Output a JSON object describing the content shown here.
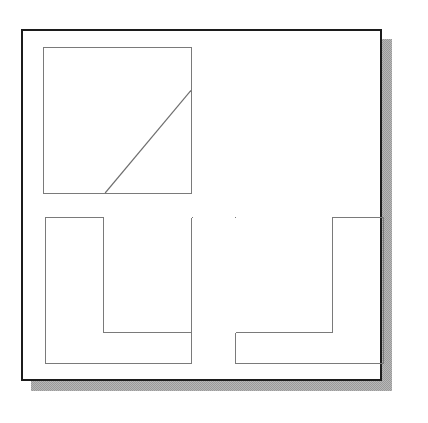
{
  "figure": {
    "title": "",
    "background_color": "#ffffff",
    "frame": {
      "name": "outer-frame",
      "x": 21,
      "y": 29,
      "width": 361,
      "height": 352,
      "stroke_color": "#1c1c1c",
      "stroke_width": 2,
      "fill_color": "#ffffff"
    },
    "shadow": {
      "name": "drop-shadow",
      "offset_x": 10,
      "offset_y": 10,
      "color": "#9a9a9a",
      "style": "dithered-halftone"
    },
    "panels": [
      {
        "id": "panel-top-left",
        "label": "",
        "shape": "square-with-diagonal",
        "x": 41,
        "y": 45,
        "width": 149,
        "height": 147,
        "stroke_color": "#7a7a7a",
        "stroke_width": 1,
        "diagonal": {
          "x1": 103,
          "y1": 192,
          "x2": 190,
          "y2": 88,
          "stroke_color": "#6e6e6e",
          "stroke_width": 1
        }
      },
      {
        "id": "panel-bottom-left",
        "label": "",
        "shape": "square-with-inset-upper-right",
        "outer": {
          "x": 43,
          "y": 215,
          "width": 147,
          "height": 147
        },
        "inner": {
          "x": 101,
          "y": 215,
          "width": 90,
          "height": 116
        },
        "stroke_color": "#7a7a7a",
        "stroke_width": 1
      },
      {
        "id": "panel-bottom-right",
        "label": "",
        "shape": "square-with-inset-upper-left",
        "outer": {
          "x": 233,
          "y": 215,
          "width": 149,
          "height": 147
        },
        "inner": {
          "x": 233,
          "y": 215,
          "width": 98,
          "height": 116
        },
        "stroke_color": "#7a7a7a",
        "stroke_width": 1
      }
    ]
  }
}
